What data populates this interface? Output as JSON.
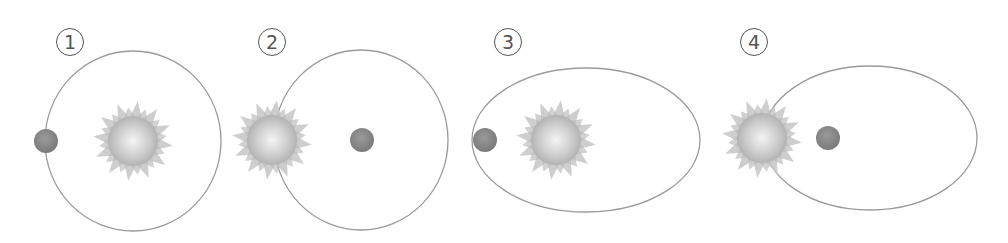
{
  "diagram": {
    "colors": {
      "orbit_line": "#9a9a9a",
      "planet": "#8c8c8c",
      "sun_rays": "#c9c9c9",
      "sun_core_light": "#f2f2f2",
      "sun_core_dark": "#b5b5b5",
      "label": "#555555"
    },
    "panels": [
      {
        "label": "1",
        "orbit": {
          "shape": "circle",
          "cx": 133,
          "cy": 141,
          "rx": 88,
          "ry": 90
        },
        "sun": {
          "cx": 133,
          "cy": 141
        },
        "planet": {
          "cx": 46,
          "cy": 141
        },
        "label_pos": {
          "x": 56,
          "y": 28
        }
      },
      {
        "label": "2",
        "orbit": {
          "shape": "circle",
          "cx": 361,
          "cy": 140,
          "rx": 87,
          "ry": 90
        },
        "sun": {
          "cx": 272,
          "cy": 140
        },
        "planet": {
          "cx": 362,
          "cy": 140
        },
        "label_pos": {
          "x": 258,
          "y": 28
        }
      },
      {
        "label": "3",
        "orbit": {
          "shape": "ellipse",
          "cx": 586,
          "cy": 140,
          "rx": 114,
          "ry": 72
        },
        "sun": {
          "cx": 556,
          "cy": 140
        },
        "planet": {
          "cx": 485,
          "cy": 140
        },
        "label_pos": {
          "x": 494,
          "y": 28
        }
      },
      {
        "label": "4",
        "orbit": {
          "shape": "ellipse",
          "cx": 870,
          "cy": 138,
          "rx": 107,
          "ry": 72
        },
        "sun": {
          "cx": 762,
          "cy": 138
        },
        "planet": {
          "cx": 828,
          "cy": 138
        },
        "label_pos": {
          "x": 740,
          "y": 28
        }
      }
    ]
  }
}
